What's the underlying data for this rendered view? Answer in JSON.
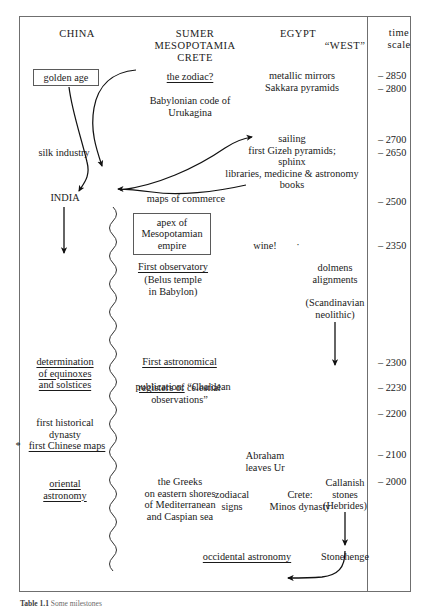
{
  "figure": {
    "caption_label": "Table 1.1",
    "caption_text": "Some milestones",
    "border_color": "#6f6f6f"
  },
  "columns": [
    {
      "id": "china",
      "label": "CHINA"
    },
    {
      "id": "sumer",
      "label": "SUMER\nMESOPOTAMIA\nCRETE"
    },
    {
      "id": "egypt",
      "label": "EGYPT"
    },
    {
      "id": "west",
      "label": "“WEST”"
    },
    {
      "id": "time",
      "label": "time\nscale"
    }
  ],
  "time_scale": {
    "ticks": [
      "– 2850",
      "– 2800",
      "– 2700",
      "– 2650",
      "– 2500",
      "– 2350",
      "– 2300",
      "– 2230",
      "– 2200",
      "– 2100",
      "– 2000"
    ]
  },
  "china": {
    "golden_age": "golden age",
    "silk_industry": "silk industry",
    "india": "INDIA",
    "equinoxes": "determination\nof equinoxes\nand solstices",
    "dynasty": "first historical\ndynasty",
    "chinese_maps": "first Chinese maps",
    "chinese_maps_marker": "*",
    "oriental_astronomy": "oriental\nastronomy"
  },
  "sumer": {
    "zodiac": "the zodiac?",
    "urukagina": "Babylonian code of\nUrukagina",
    "maps_of_commerce": "maps of commerce",
    "apex": "apex of\nMesopotamian\nempire",
    "first_observatory": "First observatory",
    "belus": "(Belus temple\nin Babylon)",
    "first_pub_line1": "First astronomical",
    "first_pub_line2": "publication:",
    "first_pub_rest": " “Chaldean",
    "first_pub_tail": "registers of celestial\nobservations”",
    "greeks": "the Greeks\non eastern shores\nof Mediterranean\nand Caspian sea"
  },
  "egypt": {
    "metallic_mirrors": "metallic mirrors\nSakkara pyramids",
    "sailing_block": "sailing\nfirst Gizeh pyramids;\nsphinx\nlibraries, medicine & astronomy\nbooks",
    "wine": "wine!",
    "wine_mark": "·",
    "abraham": "Abraham\nleaves Ur",
    "zodiacal_signs": "zodiacal\nsigns",
    "crete_minos": "Crete:\nMinos dynasty",
    "occidental_astronomy": "occidental astronomy"
  },
  "west": {
    "dolmens": "dolmens\nalignments",
    "scandinavian": "(Scandinavian\nneolithic)",
    "callanish": "Callanish\nstones\n(Hebrides)",
    "stonehenge": "Stonehenge"
  }
}
